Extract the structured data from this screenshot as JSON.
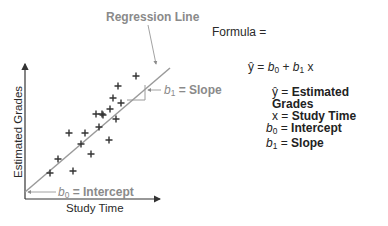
{
  "diagram": {
    "regression_label": "Regression Line",
    "y_axis_label": "Estimated Grades",
    "x_axis_label": "Study Time",
    "slope_annotation": {
      "symbol": "b",
      "sub": "1",
      "text": " = Slope"
    },
    "intercept_annotation": {
      "symbol": "b",
      "sub": "0",
      "text": " = Intercept"
    },
    "colors": {
      "line": "#9a9a9a",
      "axis": "#333333",
      "points": "#333333",
      "label_gray": "#8a8a8a"
    }
  },
  "formula": {
    "title": "Formula =",
    "equation": {
      "yhat": "ŷ",
      "eq": " = ",
      "b0": "b",
      "b0_sub": "0",
      "plus": " + ",
      "b1": "b",
      "b1_sub": "1",
      "x": " x"
    },
    "legend": [
      {
        "sym": "ŷ",
        "sub": "",
        "italic": false,
        "text": "Estimated Grades"
      },
      {
        "sym": "x",
        "sub": "",
        "italic": false,
        "text": "Study Time"
      },
      {
        "sym": "b",
        "sub": "0",
        "italic": true,
        "text": "Intercept"
      },
      {
        "sym": "b",
        "sub": "1",
        "italic": true,
        "text": "Slope"
      }
    ]
  },
  "chart_data": {
    "type": "scatter",
    "title": "",
    "xlabel": "Study Time",
    "ylabel": "Estimated Grades",
    "points_px": [
      [
        50,
        173
      ],
      [
        73,
        171
      ],
      [
        58,
        159
      ],
      [
        91,
        154
      ],
      [
        81,
        144
      ],
      [
        109,
        140
      ],
      [
        69,
        133
      ],
      [
        85,
        133
      ],
      [
        99,
        127
      ],
      [
        116,
        119
      ],
      [
        96,
        114
      ],
      [
        102,
        114
      ],
      [
        103,
        115
      ],
      [
        110,
        109
      ],
      [
        121,
        103
      ],
      [
        113,
        98
      ],
      [
        118,
        86
      ],
      [
        136,
        76
      ]
    ],
    "regression_line_px": [
      [
        25,
        192
      ],
      [
        170,
        68
      ]
    ]
  }
}
